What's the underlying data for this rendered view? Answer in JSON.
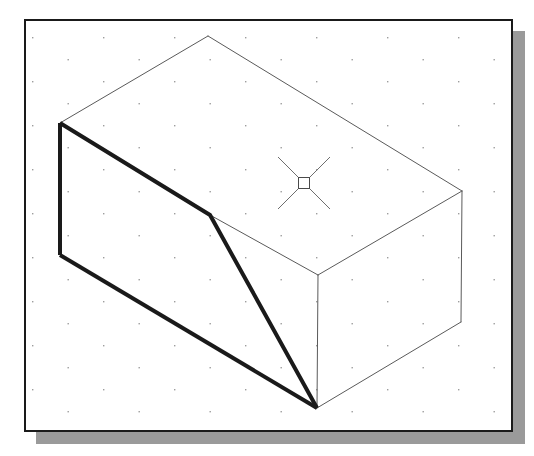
{
  "figure": {
    "type": "cad-line-drawing",
    "canvas": {
      "width": 534,
      "height": 456
    },
    "background_color": "#ffffff"
  },
  "frame": {
    "name": "drawing-window-border",
    "x": 24,
    "y": 19,
    "width": 489,
    "height": 413,
    "border_color": "#1a1a1a",
    "border_width": 2,
    "fill_color": "#ffffff"
  },
  "shadow": {
    "name": "window-drop-shadow",
    "offset_x": 12,
    "offset_y": 12,
    "color": "#9a9a9a"
  },
  "grid": {
    "name": "snap-dot-grid",
    "dot_color": "#9d9d9d",
    "dot_size": 1.4,
    "spacing_x": 71,
    "spacing_y": 22,
    "row_stagger_x": 35.5,
    "origin_x": 32,
    "origin_y": 37,
    "visible": true
  },
  "geometry": {
    "isometric_angle_deg": 30,
    "line_styles": {
      "visible_heavy": {
        "color": "#1a1a1a",
        "width": 4.0,
        "label": "object line (heavy)"
      },
      "visible_thin": {
        "color": "#5a5a5a",
        "width": 1.0,
        "label": "object line (thin)"
      }
    },
    "vertices": {
      "top_apex": [
        208,
        36
      ],
      "left_top": [
        60,
        123
      ],
      "left_bottom": [
        60,
        255
      ],
      "front_bevel": [
        210,
        215
      ],
      "front_bottom": [
        317,
        408
      ],
      "back_corner": [
        318,
        275
      ],
      "right_top": [
        462,
        191
      ],
      "right_bottom": [
        461,
        322
      ]
    },
    "edges": [
      {
        "name": "top-left-roof-edge",
        "from": "top_apex",
        "to": "left_top",
        "style": "visible_thin"
      },
      {
        "name": "top-right-roof-edge",
        "from": "top_apex",
        "to": "right_top",
        "style": "visible_thin"
      },
      {
        "name": "top-face-back-right-edge",
        "from": "right_top",
        "to": "back_corner",
        "style": "visible_thin"
      },
      {
        "name": "right-vertical-edge",
        "from": "right_top",
        "to": "right_bottom",
        "style": "visible_thin"
      },
      {
        "name": "bottom-right-edge",
        "from": "right_bottom",
        "to": "front_bottom",
        "style": "visible_thin"
      },
      {
        "name": "back-vertical-edge",
        "from": "back_corner",
        "to": "front_bottom",
        "style": "visible_thin"
      },
      {
        "name": "chamfer-back-edge",
        "from": "front_bevel",
        "to": "back_corner",
        "style": "visible_thin"
      },
      {
        "name": "left-vertical-edge",
        "from": "left_top",
        "to": "left_bottom",
        "style": "visible_heavy"
      },
      {
        "name": "chamfer-top-edge",
        "from": "left_top",
        "to": "front_bevel",
        "style": "visible_heavy"
      },
      {
        "name": "chamfer-slope-edge",
        "from": "front_bevel",
        "to": "front_bottom",
        "style": "visible_heavy"
      },
      {
        "name": "bottom-front-edge",
        "from": "left_bottom",
        "to": "front_bottom",
        "style": "visible_heavy"
      }
    ]
  },
  "cursor": {
    "name": "crosshair-pickbox-cursor",
    "center_x": 304,
    "center_y": 183,
    "arm_length": 26,
    "pickbox_size": 11,
    "color": "#6e6e6e",
    "line_width": 1
  }
}
